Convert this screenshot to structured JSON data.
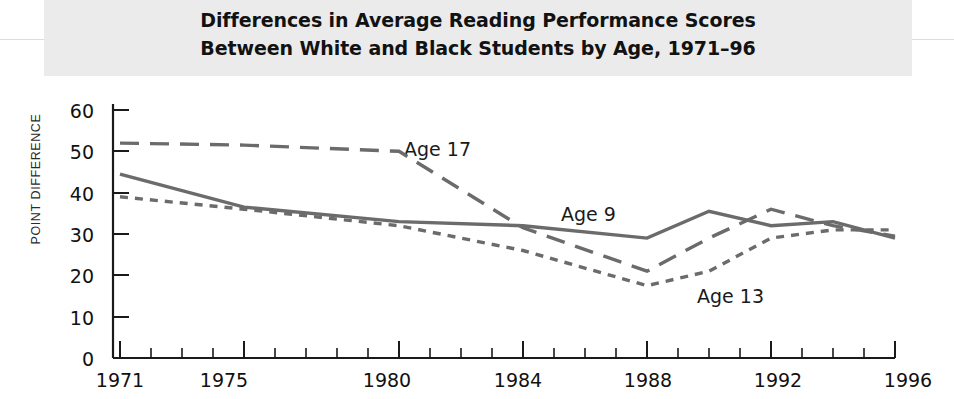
{
  "title": {
    "line1": "Differences in Average Reading Performance Scores",
    "line2": "Between White and Black Students by Age, 1971–96"
  },
  "axes": {
    "ylabel": "POINT DIFFERENCE",
    "yticks": [
      "0",
      "10",
      "20",
      "30",
      "40",
      "50",
      "60"
    ],
    "xticks": [
      "1971",
      "1975",
      "1980",
      "1984",
      "1988",
      "1992",
      "1996"
    ]
  },
  "series_labels": {
    "age17": "Age 17",
    "age9": "Age 9",
    "age13": "Age 13"
  },
  "colors": {
    "line": "#6b6b6b",
    "axis": "#1a1a1a",
    "band": "#ebebeb",
    "text": "#111111"
  },
  "chart_data": {
    "type": "line",
    "title": "Differences in Average Reading Performance Scores Between White and Black Students by Age, 1971–96",
    "xlabel": "",
    "ylabel": "POINT DIFFERENCE",
    "xlim": [
      1971,
      1996
    ],
    "ylim": [
      0,
      60
    ],
    "ytick_values": [
      0,
      10,
      20,
      30,
      40,
      50,
      60
    ],
    "xtick_values": [
      1971,
      1975,
      1980,
      1984,
      1988,
      1992,
      1996
    ],
    "minor_xticks": "every year 1971-1996",
    "grid": false,
    "legend": "inline labels next to each line",
    "series": [
      {
        "name": "Age 17",
        "style": "long-dash",
        "x": [
          1971,
          1975,
          1980,
          1984,
          1988,
          1990,
          1992,
          1994,
          1996
        ],
        "values": [
          52,
          51.5,
          50,
          31.5,
          21,
          29,
          36,
          32,
          29.5
        ]
      },
      {
        "name": "Age 9",
        "style": "solid",
        "x": [
          1971,
          1975,
          1980,
          1984,
          1988,
          1990,
          1992,
          1994,
          1996
        ],
        "values": [
          44.5,
          36.5,
          33,
          32,
          29,
          35.5,
          32,
          33,
          29
        ]
      },
      {
        "name": "Age 13",
        "style": "short-dash",
        "x": [
          1971,
          1975,
          1980,
          1984,
          1988,
          1990,
          1992,
          1994,
          1996
        ],
        "values": [
          39,
          36,
          32,
          26,
          17.5,
          21,
          29,
          31,
          31
        ]
      }
    ]
  }
}
